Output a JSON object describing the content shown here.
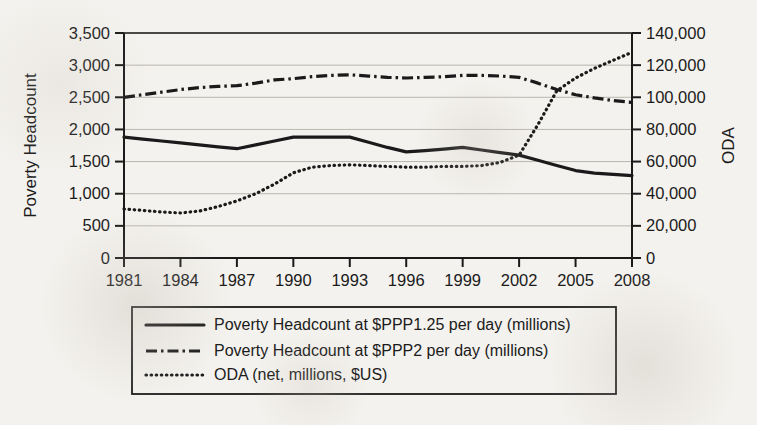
{
  "figure": {
    "kind": "dual-axis-line-chart",
    "background_color": "#f4f2ee",
    "ink_color": "#1a1a1a",
    "gridline_color": "#b9b6b0"
  },
  "axes": {
    "left": {
      "title": "Poverty Headcount",
      "tick_labels": [
        "0",
        "500",
        "1,000",
        "1,500",
        "2,000",
        "2,500",
        "3,000",
        "3,500"
      ],
      "min": 0,
      "max": 3500,
      "step": 500
    },
    "right": {
      "title": "ODA",
      "tick_labels": [
        "0",
        "20,000",
        "40,000",
        "60,000",
        "80,000",
        "100,000",
        "120,000",
        "140,000"
      ],
      "min": 0,
      "max": 140000,
      "step": 20000
    },
    "bottom": {
      "title": "",
      "tick_labels": [
        "1981",
        "1984",
        "1987",
        "1990",
        "1993",
        "1996",
        "1999",
        "2002",
        "2005",
        "2008"
      ]
    }
  },
  "legend": {
    "items": [
      {
        "label": "Poverty Headcount at $PPP1.25 per day (millions)",
        "style": "solid"
      },
      {
        "label": "Poverty Headcount at $PPP2 per day (millions)",
        "style": "dash-dot"
      },
      {
        "label": "ODA (net, millions, $US)",
        "style": "dotted"
      }
    ]
  },
  "chart_data": {
    "type": "line",
    "title": "",
    "xlabel": "",
    "ylabel": "Poverty Headcount",
    "y2label": "ODA",
    "grid": true,
    "legend_position": "below-plot",
    "xlim": [
      1981,
      2008
    ],
    "ylim": [
      0,
      3500
    ],
    "y2lim": [
      0,
      140000
    ],
    "x": [
      1981,
      1982,
      1983,
      1984,
      1985,
      1986,
      1987,
      1988,
      1989,
      1990,
      1991,
      1992,
      1993,
      1994,
      1995,
      1996,
      1997,
      1998,
      1999,
      2000,
      2001,
      2002,
      2003,
      2004,
      2005,
      2006,
      2007,
      2008
    ],
    "series": [
      {
        "name": "Poverty Headcount at $PPP1.25 per day (millions)",
        "axis": "left",
        "style": "solid",
        "values": [
          1880,
          1850,
          1820,
          1790,
          1760,
          1730,
          1700,
          1760,
          1820,
          1880,
          1880,
          1880,
          1880,
          1800,
          1720,
          1650,
          1670,
          1695,
          1720,
          1680,
          1640,
          1600,
          1520,
          1440,
          1360,
          1320,
          1300,
          1280
        ]
      },
      {
        "name": "Poverty Headcount at $PPP2 per day (millions)",
        "axis": "left",
        "style": "dash-dot",
        "values": [
          2500,
          2540,
          2580,
          2620,
          2650,
          2670,
          2680,
          2720,
          2770,
          2790,
          2820,
          2840,
          2850,
          2830,
          2810,
          2800,
          2810,
          2820,
          2840,
          2840,
          2830,
          2810,
          2720,
          2620,
          2540,
          2490,
          2450,
          2420
        ]
      },
      {
        "name": "ODA (net, millions, $US)",
        "axis": "right",
        "style": "dotted",
        "values": [
          30500,
          29600,
          28600,
          28000,
          29200,
          32000,
          35500,
          40000,
          46000,
          53000,
          56500,
          57500,
          58000,
          57500,
          57000,
          56500,
          56500,
          57000,
          57000,
          57500,
          59500,
          64000,
          83000,
          104000,
          112000,
          118000,
          123000,
          128000
        ]
      }
    ]
  }
}
